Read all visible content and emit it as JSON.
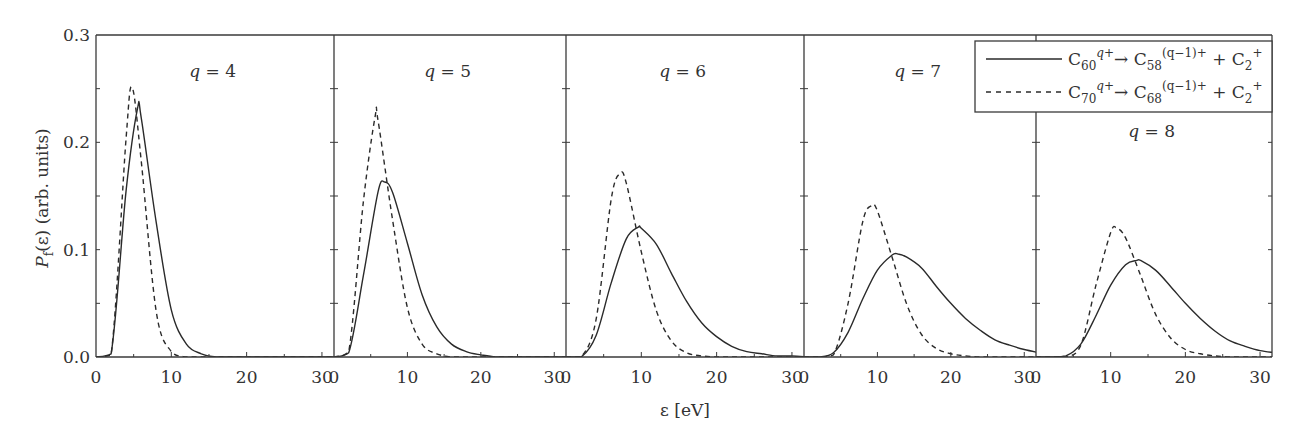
{
  "chart_data": {
    "type": "line",
    "layout": "five side-by-side panels sharing y-axis",
    "ylabel": "P_f(ε) (arb. units)",
    "ylabel_parts": {
      "main": "P",
      "sub": "f",
      "rest": "(ε) (arb. units)"
    },
    "xlabel": "ε [eV]",
    "ylim": [
      0.0,
      0.3
    ],
    "xlim_per_panel": [
      0,
      31.6
    ],
    "y_ticks": [
      "0.0",
      "0.1",
      "0.2",
      "0.3"
    ],
    "y_tick_values": [
      0.0,
      0.1,
      0.2,
      0.3
    ],
    "x_ticks": [
      "0",
      "10",
      "20",
      "30"
    ],
    "x_tick_values": [
      0,
      10,
      20,
      30
    ],
    "grid": false,
    "legend_position": "upper right",
    "legend": [
      {
        "style": "solid",
        "reactant": "C",
        "reactant_sub": "60",
        "reactant_sup": "q+",
        "arrow": "→",
        "product": "C",
        "product_sub": "58",
        "product_sup": "(q−1)+",
        "plus": "+",
        "fragment": "C",
        "fragment_sub": "2",
        "fragment_sup": "+"
      },
      {
        "style": "dashed",
        "reactant": "C",
        "reactant_sub": "70",
        "reactant_sup": "q+",
        "arrow": "→",
        "product": "C",
        "product_sub": "68",
        "product_sup": "(q−1)+",
        "plus": "+",
        "fragment": "C",
        "fragment_sub": "2",
        "fragment_sup": "+"
      }
    ],
    "x": [
      0,
      2,
      4,
      6,
      8,
      10,
      12,
      14,
      16,
      18,
      20,
      22,
      24,
      26,
      28,
      30,
      32
    ],
    "panels": [
      {
        "label": "q = 4",
        "q": 4,
        "series": [
          {
            "name": "C60 q+ → C58 (q−1)+ + C2+",
            "style": "solid",
            "peak": [
              5.5,
              0.231
            ],
            "values": [
              0,
              0.003,
              0.155,
              0.223,
              0.125,
              0.044,
              0.012,
              0.003,
              0,
              0,
              0,
              0,
              0,
              0,
              0,
              0,
              0
            ]
          },
          {
            "name": "C70 q+ → C68 (q−1)+ + C2+",
            "style": "dashed",
            "peak": [
              4.8,
              0.251
            ],
            "values": [
              0,
              0.002,
              0.204,
              0.183,
              0.042,
              0.005,
              0,
              0,
              0,
              0,
              0,
              0,
              0,
              0,
              0,
              0,
              0
            ]
          }
        ]
      },
      {
        "label": "q = 5",
        "q": 5,
        "series": [
          {
            "name": "C60 q+ → C58 (q−1)+ + C2+",
            "style": "solid",
            "peak": [
              6.9,
              0.163
            ],
            "values": [
              0,
              0.004,
              0.076,
              0.154,
              0.153,
              0.106,
              0.058,
              0.028,
              0.012,
              0.005,
              0.002,
              0,
              0,
              0,
              0,
              0,
              0
            ]
          },
          {
            "name": "C70 q+ → C68 (q−1)+ + C2+",
            "style": "dashed",
            "peak": [
              5.6,
              0.224
            ],
            "values": [
              0,
              0.005,
              0.145,
              0.22,
              0.127,
              0.046,
              0.012,
              0.003,
              0,
              0,
              0,
              0,
              0,
              0,
              0,
              0,
              0
            ]
          }
        ]
      },
      {
        "label": "q = 6",
        "q": 6,
        "series": [
          {
            "name": "C60 q+ → C58 (q−1)+ + C2+",
            "style": "solid",
            "peak": [
              9.6,
              0.121
            ],
            "values": [
              0,
              0,
              0.02,
              0.069,
              0.11,
              0.12,
              0.105,
              0.078,
              0.052,
              0.032,
              0.019,
              0.01,
              0.005,
              0.003,
              0.001,
              0.001,
              0
            ]
          },
          {
            "name": "C70 q+ → C68 (q−1)+ + C2+",
            "style": "dashed",
            "peak": [
              7.2,
              0.171
            ],
            "values": [
              0,
              0,
              0.035,
              0.147,
              0.162,
              0.098,
              0.043,
              0.015,
              0.004,
              0.001,
              0,
              0,
              0,
              0,
              0,
              0,
              0
            ]
          }
        ]
      },
      {
        "label": "q = 7",
        "q": 7,
        "series": [
          {
            "name": "C60 q+ → C58 (q−1)+ + C2+",
            "style": "solid",
            "peak": [
              12.8,
              0.096
            ],
            "values": [
              0,
              0,
              0.004,
              0.023,
              0.054,
              0.081,
              0.095,
              0.093,
              0.083,
              0.066,
              0.05,
              0.036,
              0.025,
              0.016,
              0.011,
              0.007,
              0.004
            ]
          },
          {
            "name": "C70 q+ → C68 (q−1)+ + C2+",
            "style": "dashed",
            "peak": [
              9.2,
              0.141
            ],
            "values": [
              0,
              0,
              0.002,
              0.05,
              0.126,
              0.136,
              0.093,
              0.049,
              0.021,
              0.008,
              0.003,
              0.001,
              0,
              0,
              0,
              0,
              0
            ]
          }
        ]
      },
      {
        "label": "q = 8",
        "q": 8,
        "series": [
          {
            "name": "C60 q+ → C58 (q−1)+ + C2+",
            "style": "solid",
            "peak": [
              13.5,
              0.09
            ],
            "values": [
              0,
              0,
              0.001,
              0.012,
              0.038,
              0.067,
              0.086,
              0.09,
              0.081,
              0.066,
              0.05,
              0.036,
              0.024,
              0.015,
              0.01,
              0.006,
              0.004
            ]
          },
          {
            "name": "C70 q+ → C68 (q−1)+ + C2+",
            "style": "dashed",
            "peak": [
              10.8,
              0.12
            ],
            "values": [
              0,
              0,
              0,
              0.011,
              0.066,
              0.116,
              0.111,
              0.076,
              0.04,
              0.018,
              0.007,
              0.003,
              0.001,
              0,
              0,
              0,
              0
            ]
          }
        ]
      }
    ],
    "annotations": [
      "q = 4",
      "q = 5",
      "q = 6",
      "q = 7",
      "q = 8"
    ]
  },
  "colors": {
    "line": "#2a2a2a",
    "frame": "#3a3a3a",
    "background": "#ffffff",
    "text": "#333333"
  }
}
